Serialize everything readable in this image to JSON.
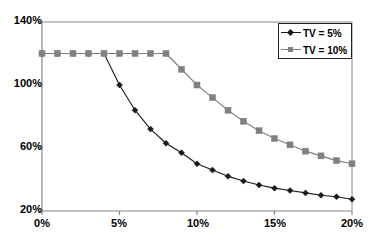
{
  "chart_data": {
    "type": "line",
    "title": "",
    "xlabel": "",
    "ylabel": "",
    "xlim": [
      0,
      20
    ],
    "ylim": [
      20,
      140
    ],
    "grid": false,
    "legend_position": "top-right",
    "x_unit": "%",
    "y_unit": "%",
    "x": [
      0,
      1,
      2,
      3,
      4,
      5,
      6,
      7,
      8,
      9,
      10,
      11,
      12,
      13,
      14,
      15,
      16,
      17,
      18,
      19,
      20
    ],
    "xticks": [
      0,
      5,
      10,
      15,
      20
    ],
    "xtick_labels": [
      "0%",
      "5%",
      "10%",
      "15%",
      "20%"
    ],
    "yticks": [
      20,
      60,
      100,
      140
    ],
    "ytick_labels": [
      "20%",
      "60%",
      "100%",
      "140%"
    ],
    "series": [
      {
        "name": "TV = 5%",
        "color": "#1a1a1a",
        "marker": "diamond",
        "values": [
          120,
          120,
          120,
          120,
          120,
          100,
          84,
          72,
          63,
          57,
          50,
          46,
          42,
          39,
          36.5,
          34.5,
          33,
          31.5,
          30,
          29,
          27.5
        ]
      },
      {
        "name": "TV = 10%",
        "color": "#808080",
        "marker": "square",
        "values": [
          120,
          120,
          120,
          120,
          120,
          120,
          120,
          120,
          120,
          110,
          100,
          92,
          84,
          77,
          71,
          66,
          62,
          58,
          55,
          52,
          50
        ]
      }
    ]
  },
  "legend": {
    "entries": [
      {
        "label": "TV = 5%"
      },
      {
        "label": "TV = 10%"
      }
    ]
  },
  "axes": {
    "axis_color": "#888888",
    "text_color": "#000000"
  }
}
